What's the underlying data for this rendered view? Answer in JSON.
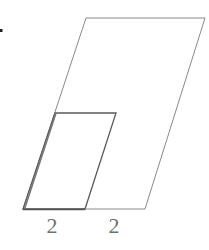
{
  "diagram": {
    "type": "nested-parallelograms",
    "outer_parallelogram": {
      "points": [
        [
          23,
          209
        ],
        [
          145,
          209
        ],
        [
          205,
          18
        ],
        [
          86,
          18
        ]
      ],
      "stroke": "#8a8a8a"
    },
    "inner_parallelogram": {
      "points": [
        [
          23,
          209
        ],
        [
          85,
          209
        ],
        [
          116,
          113
        ],
        [
          55,
          113
        ]
      ],
      "stroke": "#5a5a5a"
    },
    "labels": [
      {
        "text": "2",
        "x": 52,
        "y": 233
      },
      {
        "text": "2",
        "x": 114,
        "y": 233
      }
    ],
    "marker_dot": {
      "x": 1,
      "y": 30
    }
  }
}
